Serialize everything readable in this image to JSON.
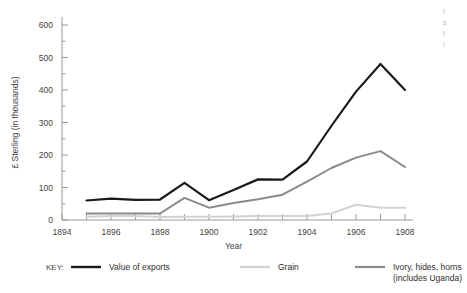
{
  "chart_data": {
    "type": "line",
    "title": "",
    "xlabel": "Year",
    "ylabel": "£ Sterling (in thousands)",
    "x": [
      1895,
      1896,
      1897,
      1898,
      1899,
      1900,
      1901,
      1902,
      1903,
      1904,
      1905,
      1906,
      1907,
      1908
    ],
    "xlim": [
      1894,
      1908
    ],
    "ylim": [
      0,
      600
    ],
    "xticks": [
      1894,
      1895,
      1896,
      1897,
      1898,
      1899,
      1900,
      1901,
      1902,
      1903,
      1904,
      1905,
      1906,
      1907,
      1908
    ],
    "xtick_labels": [
      "1894",
      "",
      "1896",
      "",
      "1898",
      "",
      "1900",
      "",
      "1902",
      "",
      "1904",
      "",
      "1906",
      "",
      "1908"
    ],
    "yticks": [
      0,
      100,
      200,
      300,
      400,
      500,
      600
    ],
    "ytick_labels": [
      "0",
      "100",
      "200",
      "300",
      "400",
      "500",
      "600"
    ],
    "y_minor_ticks": [
      50,
      150,
      250,
      350,
      450,
      550
    ],
    "grid": false,
    "legend_position": "bottom",
    "series": [
      {
        "name": "Value of exports",
        "color": "#1a1a1a",
        "width": 2.2,
        "values": [
          60,
          66,
          62,
          63,
          114,
          61,
          92,
          125,
          124,
          180,
          290,
          395,
          480,
          400
        ]
      },
      {
        "name": "Grain",
        "color": "#d2d2d2",
        "width": 2.0,
        "values": [
          10,
          12,
          12,
          9,
          10,
          10,
          11,
          12,
          12,
          12,
          20,
          47,
          38,
          38
        ]
      },
      {
        "name": "Ivory, hides, horns (includes Uganda)",
        "color": "#8a8a8a",
        "width": 2.0,
        "values": [
          20,
          20,
          20,
          20,
          68,
          38,
          52,
          64,
          78,
          118,
          160,
          192,
          212,
          163
        ]
      }
    ]
  },
  "legend": {
    "key_label": "KEY:",
    "entries": [
      {
        "label": "Value of exports",
        "label2": "",
        "color": "#1a1a1a"
      },
      {
        "label": "Grain",
        "label2": "",
        "color": "#d2d2d2"
      },
      {
        "label": "Ivory, hides, horns",
        "label2": "(includes Uganda)",
        "color": "#8a8a8a"
      }
    ]
  },
  "edge_text": {
    "line1": "t",
    "line2": "s",
    "line3": "i",
    "line4": "l"
  },
  "colors": {
    "axis": "#9a9a9a",
    "text": "#3f3f3f",
    "background": "#ffffff"
  }
}
